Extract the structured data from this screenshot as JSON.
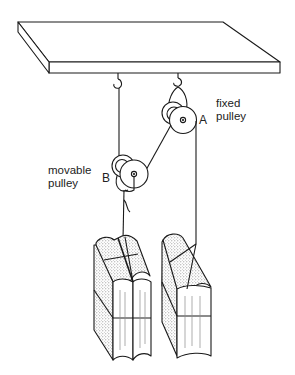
{
  "diagram": {
    "type": "pulley-system",
    "labels": {
      "fixed_pulley_line1": "fixed",
      "fixed_pulley_line2": "pulley",
      "fixed_pulley_letter": "A",
      "movable_pulley_line1": "movable",
      "movable_pulley_line2": "pulley",
      "movable_pulley_letter": "B"
    },
    "components": [
      {
        "id": "ceiling-board",
        "kind": "support beam"
      },
      {
        "id": "hook-left",
        "kind": "hook",
        "attached_to": "ceiling-board"
      },
      {
        "id": "hook-right",
        "kind": "hook",
        "attached_to": "ceiling-board"
      },
      {
        "id": "pulley-A",
        "kind": "fixed pulley",
        "hangs_from": "hook-right"
      },
      {
        "id": "pulley-B",
        "kind": "movable pulley",
        "supports": "weight-left"
      },
      {
        "id": "weight-left",
        "kind": "bundle of books"
      },
      {
        "id": "weight-right",
        "kind": "bundle of books"
      }
    ],
    "colors": {
      "line": "#1a1a1a",
      "background": "#ffffff",
      "stipple": "#9a9a9a"
    }
  }
}
